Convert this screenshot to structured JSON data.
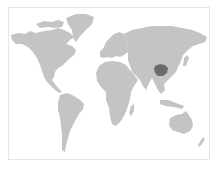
{
  "map": {
    "type": "world-locator-map",
    "projection": "equirectangular",
    "colors": {
      "background": "#ffffff",
      "frame": "#e6e6e6",
      "land": "#c4c4c4",
      "highlight": "#6b6b6b"
    },
    "highlighted_region": {
      "location": "central China"
    },
    "continents": [
      "North America",
      "Greenland",
      "South America",
      "Europe",
      "Africa",
      "Asia",
      "Australia",
      "New Zealand"
    ]
  }
}
